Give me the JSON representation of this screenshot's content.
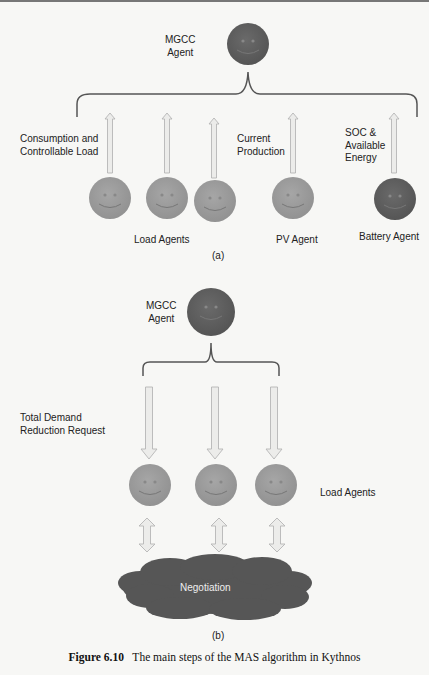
{
  "figure": {
    "part_a": {
      "sublabel": "(a)",
      "mgcc_label_line1": "MGCC",
      "mgcc_label_line2": "Agent",
      "consumption_line1": "Consumption and",
      "consumption_line2": "Controllable Load",
      "production_line1": "Current",
      "production_line2": "Production",
      "soc_line1": "SOC &",
      "soc_line2": "Available",
      "soc_line3": "Energy",
      "load_agents": "Load Agents",
      "pv_agent": "PV Agent",
      "battery_agent": "Battery Agent"
    },
    "part_b": {
      "sublabel": "(b)",
      "mgcc_label_line1": "MGCC",
      "mgcc_label_line2": "Agent",
      "request_line1": "Total Demand",
      "request_line2": "Reduction Request",
      "load_agents": "Load Agents",
      "negotiation": "Negotiation"
    },
    "caption_number": "Figure 6.10",
    "caption_text": "The main steps of the MAS algorithm in Kythnos"
  },
  "colors": {
    "dark_agent": "#5e5e5e",
    "light_agent": "#9a9a9a",
    "arrow_fill": "#ececea",
    "arrow_stroke": "#b5b5b5",
    "cloud": "#565656",
    "bracket": "#555555"
  }
}
